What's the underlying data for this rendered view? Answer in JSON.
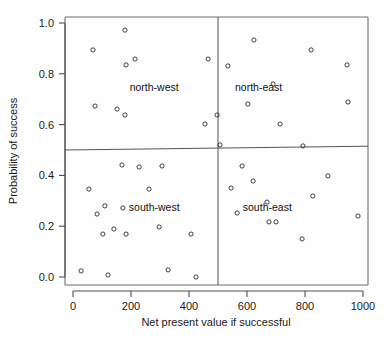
{
  "chart_data": {
    "type": "scatter",
    "title": "",
    "xlabel": "Net present value if successful",
    "ylabel": "Probability of success",
    "xlim": [
      0,
      1000
    ],
    "ylim": [
      0.0,
      1.0
    ],
    "xticks": [
      0,
      200,
      400,
      600,
      800,
      1000
    ],
    "xticklabels": [
      "0",
      "200",
      "400",
      "600",
      "800",
      "1000"
    ],
    "yticks": [
      0.0,
      0.2,
      0.4,
      0.6,
      0.8,
      1.0
    ],
    "yticklabels": [
      "0.0",
      "0.2",
      "0.4",
      "0.6",
      "0.8",
      "1.0"
    ],
    "grid": false,
    "legend": "none",
    "marker": "open-circle",
    "marker_color": "#2b2b2b",
    "reference_lines": [
      {
        "name": "vertical-divider",
        "orientation": "vertical",
        "x": 500
      },
      {
        "name": "horizontal-divider",
        "orientation": "horizontal",
        "y_left": 0.5,
        "y_right": 0.515
      }
    ],
    "annotations": [
      {
        "text": "north-west",
        "x": 280,
        "y": 0.745
      },
      {
        "text": "north-east",
        "x": 640,
        "y": 0.745
      },
      {
        "text": "south-west",
        "x": 280,
        "y": 0.275
      },
      {
        "text": "south-east",
        "x": 670,
        "y": 0.275
      }
    ],
    "points": [
      {
        "x": 179,
        "y": 0.972
      },
      {
        "x": 69,
        "y": 0.894
      },
      {
        "x": 214,
        "y": 0.858
      },
      {
        "x": 183,
        "y": 0.835
      },
      {
        "x": 466,
        "y": 0.858
      },
      {
        "x": 76,
        "y": 0.673
      },
      {
        "x": 152,
        "y": 0.661
      },
      {
        "x": 179,
        "y": 0.638
      },
      {
        "x": 455,
        "y": 0.602
      },
      {
        "x": 624,
        "y": 0.933
      },
      {
        "x": 821,
        "y": 0.894
      },
      {
        "x": 534,
        "y": 0.831
      },
      {
        "x": 945,
        "y": 0.835
      },
      {
        "x": 690,
        "y": 0.76
      },
      {
        "x": 948,
        "y": 0.689
      },
      {
        "x": 603,
        "y": 0.681
      },
      {
        "x": 714,
        "y": 0.602
      },
      {
        "x": 497,
        "y": 0.638
      },
      {
        "x": 507,
        "y": 0.52
      },
      {
        "x": 793,
        "y": 0.516
      },
      {
        "x": 169,
        "y": 0.441
      },
      {
        "x": 228,
        "y": 0.433
      },
      {
        "x": 307,
        "y": 0.437
      },
      {
        "x": 55,
        "y": 0.346
      },
      {
        "x": 262,
        "y": 0.346
      },
      {
        "x": 110,
        "y": 0.28
      },
      {
        "x": 83,
        "y": 0.248
      },
      {
        "x": 172,
        "y": 0.272
      },
      {
        "x": 103,
        "y": 0.169
      },
      {
        "x": 141,
        "y": 0.189
      },
      {
        "x": 183,
        "y": 0.169
      },
      {
        "x": 297,
        "y": 0.197
      },
      {
        "x": 407,
        "y": 0.169
      },
      {
        "x": 28,
        "y": 0.024
      },
      {
        "x": 121,
        "y": 0.008
      },
      {
        "x": 328,
        "y": 0.028
      },
      {
        "x": 424,
        "y": 0.0
      },
      {
        "x": 583,
        "y": 0.437
      },
      {
        "x": 621,
        "y": 0.378
      },
      {
        "x": 545,
        "y": 0.35
      },
      {
        "x": 879,
        "y": 0.398
      },
      {
        "x": 669,
        "y": 0.295
      },
      {
        "x": 566,
        "y": 0.252
      },
      {
        "x": 676,
        "y": 0.217
      },
      {
        "x": 700,
        "y": 0.217
      },
      {
        "x": 983,
        "y": 0.24
      },
      {
        "x": 790,
        "y": 0.15
      },
      {
        "x": 827,
        "y": 0.319
      }
    ]
  }
}
